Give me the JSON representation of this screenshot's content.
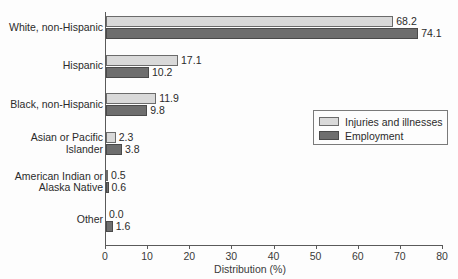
{
  "chart_data": {
    "type": "bar",
    "orientation": "horizontal",
    "title": "",
    "xlabel": "Distribution (%)",
    "ylabel": "",
    "xlim": [
      0,
      80
    ],
    "xticks": [
      0,
      10,
      20,
      30,
      40,
      50,
      60,
      70,
      80
    ],
    "grid": false,
    "legend_position": "middle-right",
    "categories": [
      "White, non-Hispanic",
      "Hispanic",
      "Black, non-Hispanic",
      "Asian or Pacific\nIslander",
      "American Indian or\nAlaska Native",
      "Other"
    ],
    "series": [
      {
        "name": "Injuries and illnesses",
        "color": "#d9d9d9",
        "values": [
          68.2,
          17.1,
          11.9,
          2.3,
          0.5,
          0.0
        ],
        "labels": [
          "68.2",
          "17.1",
          "11.9",
          "2.3",
          "0.5",
          "0.0"
        ]
      },
      {
        "name": "Employment",
        "color": "#6e6e6e",
        "values": [
          74.1,
          10.2,
          9.8,
          3.8,
          0.6,
          1.6
        ],
        "labels": [
          "74.1",
          "10.2",
          "9.8",
          "3.8",
          "0.6",
          "1.6"
        ]
      }
    ]
  },
  "axis": {
    "tick_labels": [
      "0",
      "10",
      "20",
      "30",
      "40",
      "50",
      "60",
      "70",
      "80"
    ],
    "x_title": "Distribution (%)"
  },
  "legend": {
    "items": [
      {
        "label": "Injuries and illnesses",
        "swatch": "light"
      },
      {
        "label": "Employment",
        "swatch": "dark"
      }
    ]
  }
}
